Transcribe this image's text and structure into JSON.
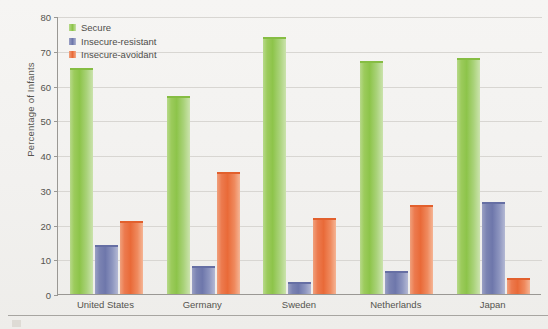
{
  "chart_data": {
    "type": "bar",
    "title": "",
    "xlabel": "",
    "ylabel": "Percentage of Infants",
    "ylim": [
      0,
      80
    ],
    "yticks": [
      0,
      10,
      20,
      30,
      40,
      50,
      60,
      70,
      80
    ],
    "grid": true,
    "legend_position": "top-left",
    "categories": [
      "United States",
      "Germany",
      "Sweden",
      "Netherlands",
      "Japan"
    ],
    "series": [
      {
        "name": "Secure",
        "color": "#8dc44a",
        "values": [
          65,
          57,
          74,
          67,
          68
        ]
      },
      {
        "name": "Insecure-resistant",
        "color": "#6e77ab",
        "values": [
          14,
          8,
          3.5,
          6.5,
          26.5
        ]
      },
      {
        "name": "Insecure-avoidant",
        "color": "#e96a38",
        "values": [
          21,
          35,
          22,
          25.5,
          4.5
        ]
      }
    ]
  },
  "axis": {
    "y_title": "Percentage of Infants",
    "y_ticks": [
      "80",
      "70",
      "60",
      "50",
      "40",
      "30",
      "20",
      "10",
      "0"
    ],
    "x_ticks": [
      "United States",
      "Germany",
      "Sweden",
      "Netherlands",
      "Japan"
    ]
  },
  "legend": {
    "items": [
      {
        "label": "Secure"
      },
      {
        "label": "Insecure-resistant"
      },
      {
        "label": "Insecure-avoidant"
      }
    ]
  }
}
